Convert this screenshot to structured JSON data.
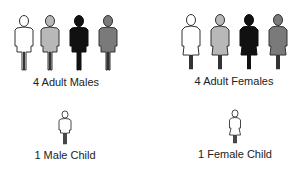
{
  "groups": [
    {
      "id": "adult-males",
      "label": "4 Adult Males",
      "count": 4,
      "figure": "adult-male",
      "fills": [
        "#ffffff",
        "#b8b8b8",
        "#111111",
        "#7a7a7a"
      ]
    },
    {
      "id": "adult-females",
      "label": "4 Adult Females",
      "count": 4,
      "figure": "adult-female",
      "fills": [
        "#ffffff",
        "#b8b8b8",
        "#111111",
        "#7a7a7a"
      ]
    },
    {
      "id": "male-child",
      "label": "1 Male Child",
      "count": 1,
      "figure": "child-male",
      "fills": [
        "#ffffff"
      ]
    },
    {
      "id": "female-child",
      "label": "1 Female Child",
      "count": 1,
      "figure": "child-female",
      "fills": [
        "#ffffff"
      ]
    }
  ],
  "stroke_color": "#333333"
}
